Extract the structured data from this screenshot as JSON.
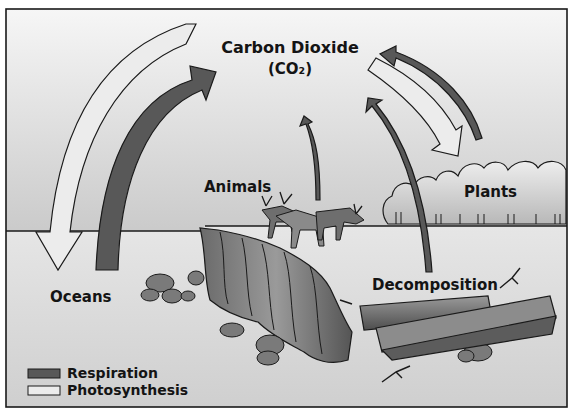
{
  "diagram": {
    "title": "Carbon Dioxide",
    "formula": "(CO₂)",
    "labels": {
      "animals": "Animals",
      "plants": "Plants",
      "oceans": "Oceans",
      "decomposition": "Decomposition"
    },
    "legend": [
      {
        "label": "Respiration",
        "swatch_color": "#585858",
        "meaning": "dark arrow"
      },
      {
        "label": "Photosynthesis",
        "swatch_color": "#ececec",
        "meaning": "light arrow"
      }
    ],
    "arrows": [
      {
        "from": "Carbon Dioxide",
        "to": "Oceans",
        "type": "Photosynthesis"
      },
      {
        "from": "Oceans",
        "to": "Carbon Dioxide",
        "type": "Respiration"
      },
      {
        "from": "Animals",
        "to": "Carbon Dioxide",
        "type": "Respiration"
      },
      {
        "from": "Decomposition",
        "to": "Carbon Dioxide",
        "type": "Respiration"
      },
      {
        "from": "Carbon Dioxide",
        "to": "Plants",
        "type": "Photosynthesis"
      },
      {
        "from": "Plants",
        "to": "Carbon Dioxide",
        "type": "Respiration"
      }
    ],
    "colors": {
      "sky_top": "#f4f4f4",
      "sky_bottom": "#a9a9a9",
      "land": "#dcdcdc",
      "respiration": "#585858",
      "photosynthesis": "#ececec",
      "outline": "#1a1a1a"
    }
  }
}
